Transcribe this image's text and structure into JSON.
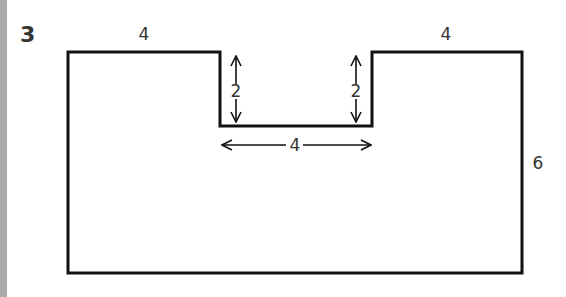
{
  "problem": {
    "number": "3"
  },
  "diagram": {
    "shape": "rectangle-with-notch",
    "labels": {
      "top_left_width": "4",
      "top_right_width": "4",
      "notch_left_depth": "2",
      "notch_right_depth": "2",
      "notch_width": "4",
      "right_height": "6"
    },
    "colors": {
      "stroke": "#111111",
      "text": "#333333",
      "side_bar": "#a9a9a9"
    }
  }
}
